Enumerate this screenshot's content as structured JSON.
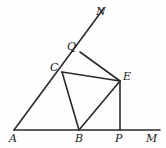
{
  "figure": {
    "type": "geometry-diagram",
    "background_color": "#fefefe",
    "stroke_color": "#2a2a2a",
    "label_color": "#1b1b1b",
    "width": 166,
    "height": 148,
    "points": {
      "A": {
        "label": "A",
        "x": 14,
        "y": 130,
        "label_x": 9,
        "label_y": 133
      },
      "B": {
        "label": "B",
        "x": 79,
        "y": 130,
        "label_x": 75,
        "label_y": 133
      },
      "P": {
        "label": "P",
        "x": 120,
        "y": 130,
        "label_x": 115,
        "label_y": 133
      },
      "M": {
        "label": "M",
        "x": 160,
        "y": 130,
        "label_x": 146,
        "label_y": 133
      },
      "C": {
        "label": "C",
        "x": 62,
        "y": 72,
        "label_x": 50,
        "label_y": 62
      },
      "Q": {
        "label": "Q",
        "x": 80,
        "y": 52,
        "label_x": 67,
        "label_y": 41
      },
      "N": {
        "label": "N",
        "x": 104,
        "y": 8,
        "label_x": 96,
        "label_y": 6
      },
      "E": {
        "label": "E",
        "x": 120,
        "y": 81,
        "label_x": 123,
        "label_y": 71
      }
    },
    "segments": [
      {
        "name": "baseline-AM",
        "from": "A",
        "to": "M",
        "width": 1.6
      },
      {
        "name": "ray-AN",
        "from": "A",
        "to": "N",
        "width": 1.6
      },
      {
        "name": "segment-CE",
        "from": "C",
        "to": "E",
        "width": 1.6
      },
      {
        "name": "segment-CB",
        "from": "C",
        "to": "B",
        "width": 1.6
      },
      {
        "name": "segment-BE",
        "from": "B",
        "to": "E",
        "width": 1.6
      },
      {
        "name": "segment-QE",
        "from": "Q",
        "to": "E",
        "width": 1.6
      },
      {
        "name": "segment-EP",
        "from": "E",
        "to": "P",
        "width": 1.6
      }
    ]
  }
}
